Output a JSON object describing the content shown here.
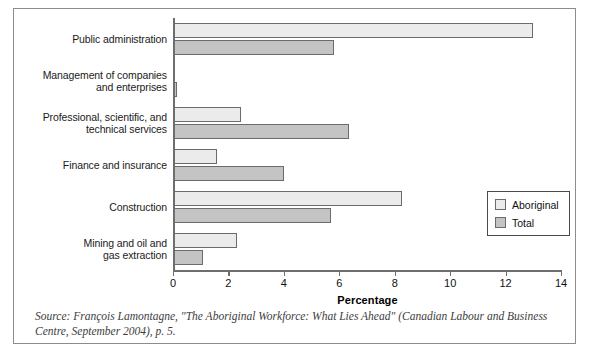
{
  "figure": {
    "source_note": "Source: François Lamontagne, \"The Aboriginal Workforce: What Lies Ahead\" (Canadian Labour and Business Centre, September 2004), p. 5."
  },
  "legend": {
    "position": "inside-right-lower",
    "items": [
      {
        "label": "Aboriginal",
        "color": "#ebebeb",
        "swatch_name": "legend-swatch-aboriginal"
      },
      {
        "label": "Total",
        "color": "#c4c4c4",
        "swatch_name": "legend-swatch-total"
      }
    ]
  },
  "axis": {
    "x_title": "Percentage",
    "ticks": [
      "0",
      "2",
      "4",
      "6",
      "8",
      "10",
      "12",
      "14"
    ]
  },
  "chart_data": {
    "type": "bar",
    "orientation": "horizontal",
    "title": "",
    "subtitle": "",
    "xlabel": "Percentage",
    "ylabel": "",
    "xlim": [
      0,
      14
    ],
    "xticks": [
      0,
      2,
      4,
      6,
      8,
      10,
      12,
      14
    ],
    "grid": false,
    "legend_position": "inside right lower",
    "categories": [
      "Public administration",
      "Management of companies and enterprises",
      "Professional, scientific, and technical services",
      "Finance and insurance",
      "Construction",
      "Mining and oil and gas extraction"
    ],
    "category_lines": [
      [
        "Public administration"
      ],
      [
        "Management of companies",
        "and enterprises"
      ],
      [
        "Professional, scientific, and",
        "technical services"
      ],
      [
        "Finance and insurance"
      ],
      [
        "Construction"
      ],
      [
        "Mining and oil and",
        "gas extraction"
      ]
    ],
    "series": [
      {
        "name": "Aboriginal",
        "color": "#ebebeb",
        "values": [
          13.0,
          0.0,
          2.45,
          1.6,
          8.25,
          2.3
        ]
      },
      {
        "name": "Total",
        "color": "#c4c4c4",
        "values": [
          5.8,
          0.15,
          6.35,
          4.0,
          5.7,
          1.1
        ]
      }
    ]
  }
}
